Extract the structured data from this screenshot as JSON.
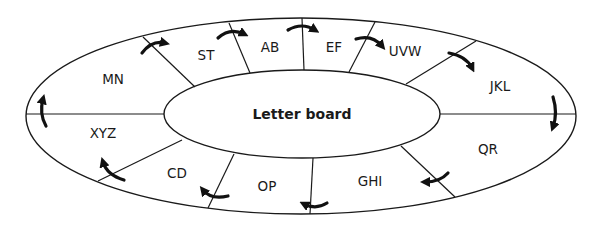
{
  "diagram": {
    "center_label": "Letter board",
    "direction": "clockwise",
    "colors": {
      "line": "#1a1a1a",
      "arrow": "#111111",
      "background": "#ffffff"
    },
    "segments": [
      {
        "label": "AB",
        "x": 270,
        "y": 48
      },
      {
        "label": "EF",
        "x": 334,
        "y": 48
      },
      {
        "label": "UVW",
        "x": 405,
        "y": 52
      },
      {
        "label": "JKL",
        "x": 500,
        "y": 87
      },
      {
        "label": "QR",
        "x": 488,
        "y": 150
      },
      {
        "label": "GHI",
        "x": 370,
        "y": 182
      },
      {
        "label": "OP",
        "x": 267,
        "y": 187
      },
      {
        "label": "CD",
        "x": 177,
        "y": 174
      },
      {
        "label": "XYZ",
        "x": 103,
        "y": 134
      },
      {
        "label": "MN",
        "x": 113,
        "y": 80
      },
      {
        "label": "ST",
        "x": 206,
        "y": 56
      }
    ]
  }
}
